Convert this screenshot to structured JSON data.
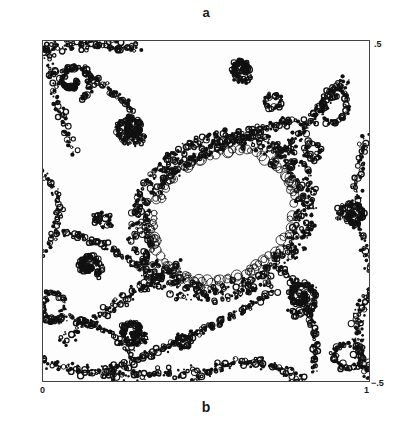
{
  "figure": {
    "panel_label_top": "a",
    "panel_label_bottom": "b",
    "axes": {
      "x_ticks": {
        "left": "0",
        "right": "1"
      },
      "y_ticks": {
        "top": ".5",
        "bottom": "−.5"
      }
    },
    "colors": {
      "ink": "#111111",
      "paper": "#ffffff",
      "frame": "#444444"
    }
  }
}
